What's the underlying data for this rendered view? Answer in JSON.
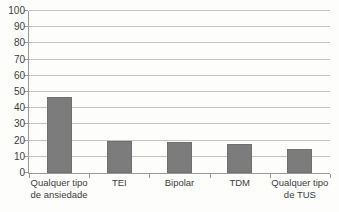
{
  "chart_data": {
    "type": "bar",
    "title": "",
    "xlabel": "",
    "ylabel": "",
    "categories": [
      "Qualquer tipo\nde ansiedade",
      "TEI",
      "Bipolar",
      "TDM",
      "Qualquer tipo\nde TUS"
    ],
    "values": [
      47,
      20,
      19,
      18,
      15
    ],
    "ylim": [
      0,
      100
    ],
    "yticks": [
      0,
      10,
      20,
      30,
      40,
      50,
      60,
      70,
      80,
      90,
      100
    ],
    "grid": true,
    "legend": false,
    "colors": {
      "bar": "#7c7c7c",
      "bar_border": "#6f6f6f",
      "gridline": "#c3c3c3",
      "axis": "#999999",
      "text": "#3d3d3d",
      "background": "#fdfdfc"
    }
  }
}
